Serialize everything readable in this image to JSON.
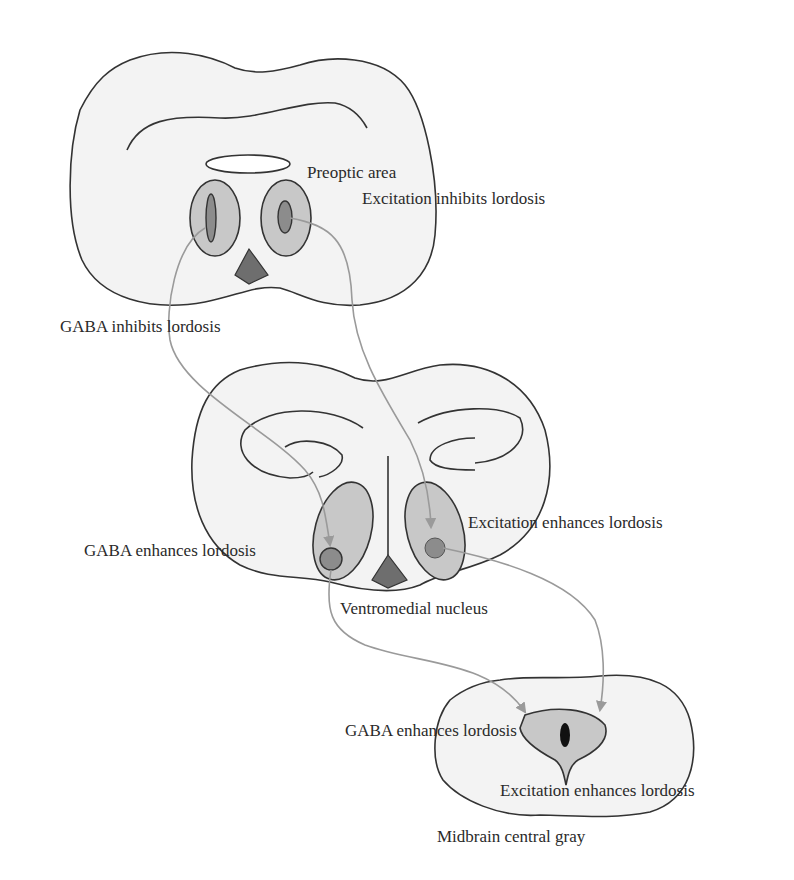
{
  "diagram": {
    "type": "neuroanatomy-schematic",
    "sections": [
      {
        "id": "preoptic",
        "label": "Preoptic area"
      },
      {
        "id": "vmn",
        "label": "Ventromedial nucleus"
      },
      {
        "id": "cg",
        "label": "Midbrain central gray"
      }
    ],
    "labels": {
      "preoptic_area": "Preoptic area",
      "poa_excitation": "Excitation inhibits lordosis",
      "poa_gaba": "GABA inhibits lordosis",
      "vmn_excitation": "Excitation enhances lordosis",
      "vmn_gaba": "GABA enhances lordosis",
      "vmn_name": "Ventromedial nucleus",
      "cg_gaba": "GABA enhances lordosis",
      "cg_excitation": "Excitation enhances lordosis",
      "cg_name": "Midbrain central gray"
    },
    "connections": [
      {
        "from": "Preoptic area (left nucleus)",
        "to": "Ventromedial nucleus (left)"
      },
      {
        "from": "Preoptic area (right nucleus)",
        "to": "Ventromedial nucleus (right)"
      },
      {
        "from": "Ventromedial nucleus (left)",
        "to": "Midbrain central gray"
      },
      {
        "from": "Ventromedial nucleus (right)",
        "to": "Midbrain central gray"
      }
    ],
    "colors": {
      "outline": "#333333",
      "section_fill": "#f3f3f3",
      "nucleus_fill": "#c8c8c8",
      "core_fill": "#8c8c8c",
      "arrow": "#9a9a9a",
      "text": "#2a2a2a"
    }
  }
}
